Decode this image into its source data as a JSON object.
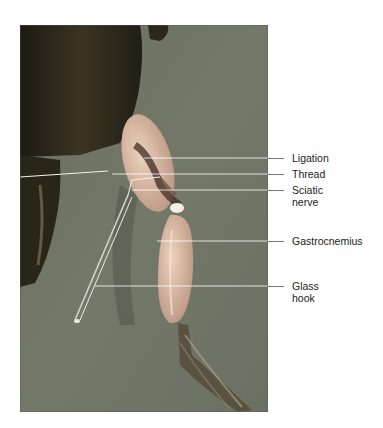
{
  "figure": {
    "labels": [
      {
        "id": "ligation",
        "text": "Ligation"
      },
      {
        "id": "thread",
        "text": "Thread"
      },
      {
        "id": "sciatic-nerve",
        "text": "Sciatic nerve",
        "line1": "Sciatic",
        "line2": "nerve"
      },
      {
        "id": "gastrocnemius",
        "text": "Gastrocnemius"
      },
      {
        "id": "glass-hook",
        "text": "Glass hook",
        "line1": "Glass",
        "line2": "hook"
      }
    ],
    "colors": {
      "background_tray": "#6f7464",
      "frog_skin": "#2f2a1e",
      "muscle": "#d8b8a0",
      "leader_line": "#ffffff"
    }
  }
}
